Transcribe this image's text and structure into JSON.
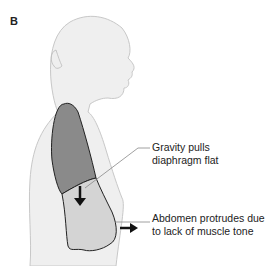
{
  "figure": {
    "panel_label": "B",
    "colors": {
      "body_fill": "#efefef",
      "body_stroke": "#c8c8c8",
      "lung_fill": "#8a8a8a",
      "abdomen_fill": "#d4d4d4",
      "outline": "#222222",
      "leader_line": "#888888",
      "arrow": "#111111"
    },
    "callouts": [
      {
        "id": "gravity",
        "lines": [
          "Gravity pulls",
          "diaphragm flat"
        ]
      },
      {
        "id": "abdomen",
        "lines": [
          "Abdomen protrudes due",
          "to lack of muscle tone"
        ]
      }
    ]
  }
}
